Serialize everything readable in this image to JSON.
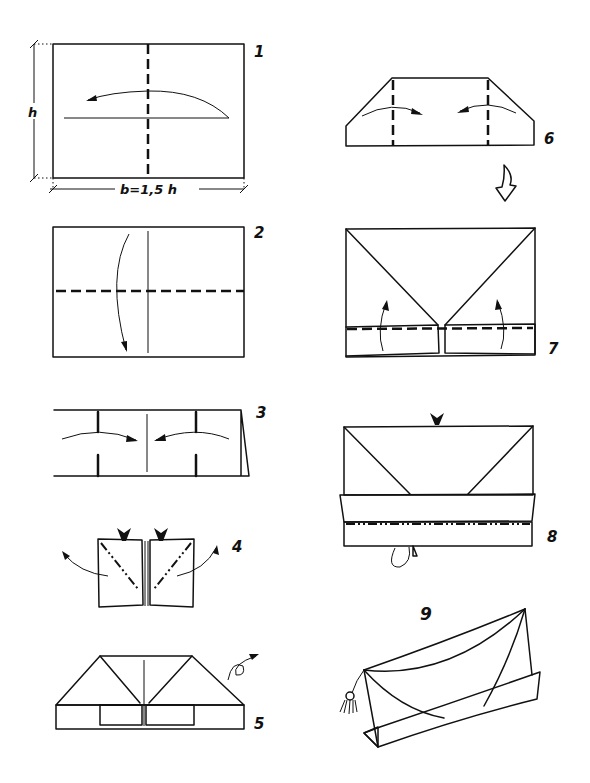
{
  "diagram": {
    "dimension_height_label": "h",
    "dimension_width_label": "b=1,5 h",
    "steps": [
      {
        "number": "1",
        "description": "Rectangle with vertical dashed fold line, arrow folding right to left"
      },
      {
        "number": "2",
        "description": "Folded in half; horizontal dashed fold line, arrow folding top down"
      },
      {
        "number": "3",
        "description": "Folded strip; two vertical dashed lines, arrows folding towards center"
      },
      {
        "number": "4",
        "description": "Two folded flaps with dash-dot diagonal lines; arrows opening outward"
      },
      {
        "number": "5",
        "description": "Triangular top with rectangular base; turn over symbol"
      },
      {
        "number": "6",
        "description": "Trapezoid with two vertical dashed lines, arrows folding inward; hollow arrow down"
      },
      {
        "number": "7",
        "description": "Rectangle with triangle folds; bottom dashed line with arrows folding up"
      },
      {
        "number": "8",
        "description": "Rectangle with band; dash-dot line at bottom, fold behind"
      },
      {
        "number": "9",
        "description": "Finished hat with tassel"
      }
    ]
  }
}
